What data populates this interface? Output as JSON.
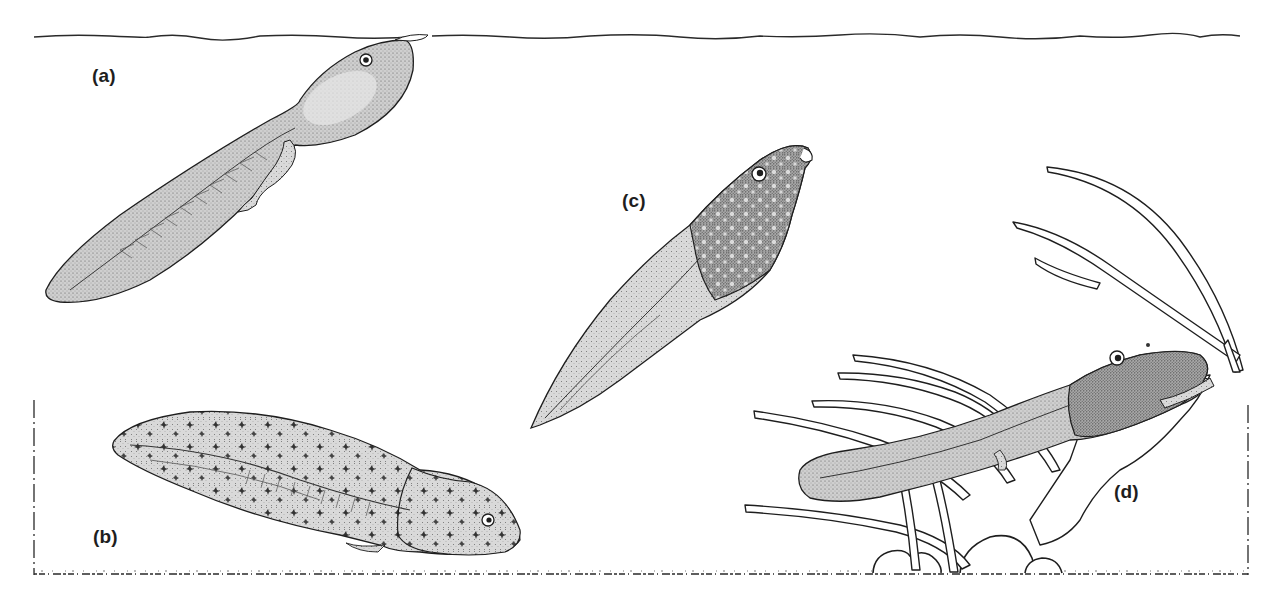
{
  "figure": {
    "colors": {
      "background": "#ffffff",
      "ink": "#1e1e1e",
      "body_fill": "#c9c9c9",
      "body_fill_dark": "#9a9a9a",
      "tail_fill": "#d6d6d6"
    },
    "labels": [
      {
        "id": "a",
        "text": "(a)",
        "x": 92,
        "y": 66
      },
      {
        "id": "b",
        "text": "(b)",
        "x": 93,
        "y": 527
      },
      {
        "id": "c",
        "text": "(c)",
        "x": 622,
        "y": 191
      },
      {
        "id": "d",
        "text": "(d)",
        "x": 1114,
        "y": 482
      }
    ],
    "elements": {
      "water_surface": "wavy line across top of figure",
      "substrate": "dotted bottom line with rocks",
      "plants": "aquatic plant fronds at right",
      "tadpoles": [
        {
          "id": "a",
          "pose": "hanging at surface, hind legs present"
        },
        {
          "id": "b",
          "pose": "resting near bottom, early stage"
        },
        {
          "id": "c",
          "pose": "diagonal upward, front limbs emerging"
        },
        {
          "id": "d",
          "pose": "climbing onto plant, late stage"
        }
      ]
    }
  }
}
